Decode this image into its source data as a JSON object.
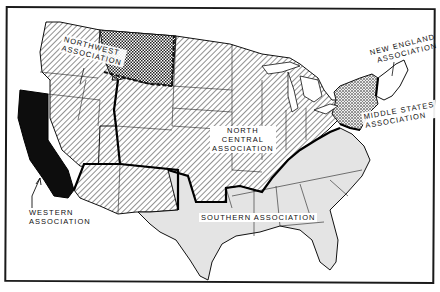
{
  "map": {
    "subject": "United States regional accrediting associations",
    "regions": [
      {
        "id": "northwest",
        "label_line1": "Northwest",
        "label_line2": "Association",
        "fill": "crosshatch-checker",
        "color": "#555555"
      },
      {
        "id": "north_central",
        "label_line1": "North",
        "label_line2": "Central",
        "label_line3": "Association",
        "fill": "diagonal-hatch",
        "color": "#777777"
      },
      {
        "id": "new_england",
        "label_line1": "New England",
        "label_line2": "Association",
        "fill": "white",
        "color": "#ffffff"
      },
      {
        "id": "middle_states",
        "label_line1": "Middle States",
        "label_line2": "Association",
        "fill": "stipple",
        "color": "#666666"
      },
      {
        "id": "southern",
        "label_line1": "Southern Association",
        "fill": "light-gray",
        "color": "#e4e4e4"
      },
      {
        "id": "western",
        "label_line1": "Western",
        "label_line2": "Association",
        "fill": "solid-black",
        "color": "#0d0d0d"
      }
    ],
    "boundary_style": {
      "association_border": "thick black",
      "state_border": "thin black",
      "northwest_montana_border": "dashed thick"
    }
  }
}
